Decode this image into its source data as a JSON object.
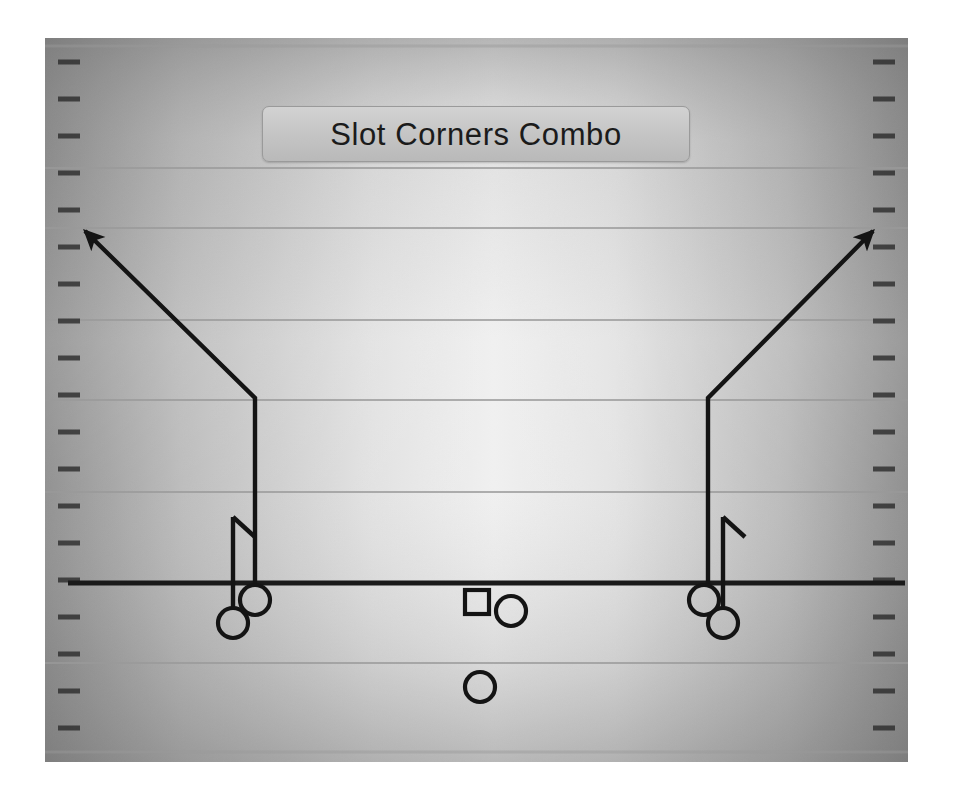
{
  "diagram": {
    "title": "Slot Corners Combo",
    "type": "american-football-play-diagram",
    "colors": {
      "field_edge": "#8f8f8f",
      "field_center": "#fbfbfb",
      "yard_line": "#9a9a9a",
      "line_of_scrimmage": "#1a1a1a",
      "route_line": "#141414",
      "player_marker": "#141414",
      "title_bar": "#c6c6c6",
      "title_text": "#1b1b1b",
      "page_background": "#ffffff"
    },
    "field": {
      "x": 45,
      "y": 38,
      "width": 863,
      "height": 724,
      "hash_mark_spacing": 37,
      "hash_mark_length": 20,
      "sideline_inset": 8
    },
    "yard_lines": [
      {
        "name": "yard-line-1",
        "y": 168,
        "weight": "thin"
      },
      {
        "name": "yard-line-2",
        "y": 228,
        "weight": "thin"
      },
      {
        "name": "yard-line-3",
        "y": 320,
        "weight": "thin"
      },
      {
        "name": "yard-line-4",
        "y": 400,
        "weight": "thin"
      },
      {
        "name": "yard-line-5",
        "y": 492,
        "weight": "thin"
      },
      {
        "name": "yard-line-6",
        "y": 663,
        "weight": "thin"
      }
    ],
    "line_of_scrimmage": {
      "name": "line-of-scrimmage",
      "y": 583,
      "x1": 68,
      "x2": 905,
      "weight": 5
    },
    "players": [
      {
        "id": "left-outside-receiver",
        "label": "",
        "shape": "circle",
        "cx": 233,
        "cy": 623,
        "r": 15
      },
      {
        "id": "left-slot-receiver",
        "label": "",
        "shape": "circle",
        "cx": 255,
        "cy": 600,
        "r": 15
      },
      {
        "id": "center",
        "label": "",
        "shape": "square",
        "x": 465,
        "y": 590,
        "size": 24
      },
      {
        "id": "quarterback",
        "label": "",
        "shape": "circle",
        "cx": 511,
        "cy": 611,
        "r": 15
      },
      {
        "id": "running-back",
        "label": "",
        "shape": "circle",
        "cx": 480,
        "cy": 687,
        "r": 15
      },
      {
        "id": "right-slot-receiver",
        "label": "",
        "shape": "circle",
        "cx": 704,
        "cy": 600,
        "r": 15
      },
      {
        "id": "right-outside-receiver",
        "label": "",
        "shape": "circle",
        "cx": 723,
        "cy": 623,
        "r": 15
      }
    ],
    "routes": [
      {
        "id": "left-corner-route",
        "player": "left-slot-receiver",
        "description": "vertical stem then corner break to the left sideline",
        "points": [
          [
            255,
            585
          ],
          [
            255,
            398
          ],
          [
            85,
            231
          ]
        ],
        "ending": "arrow"
      },
      {
        "id": "right-corner-route",
        "player": "right-slot-receiver",
        "description": "vertical stem then corner break to the right sideline",
        "points": [
          [
            708,
            585
          ],
          [
            708,
            398
          ],
          [
            873,
            231
          ]
        ],
        "ending": "arrow"
      },
      {
        "id": "left-hook-route",
        "player": "left-outside-receiver",
        "description": "short vertical stem with outbreaking flag tick",
        "points": [
          [
            233,
            608
          ],
          [
            233,
            517
          ]
        ],
        "ending": "flag",
        "flag": [
          [
            233,
            517
          ],
          [
            254,
            536
          ]
        ]
      },
      {
        "id": "right-hook-route",
        "player": "right-outside-receiver",
        "description": "short vertical stem with outbreaking flag tick",
        "points": [
          [
            723,
            608
          ],
          [
            723,
            517
          ]
        ],
        "ending": "flag",
        "flag": [
          [
            723,
            517
          ],
          [
            744,
            536
          ]
        ]
      }
    ]
  }
}
